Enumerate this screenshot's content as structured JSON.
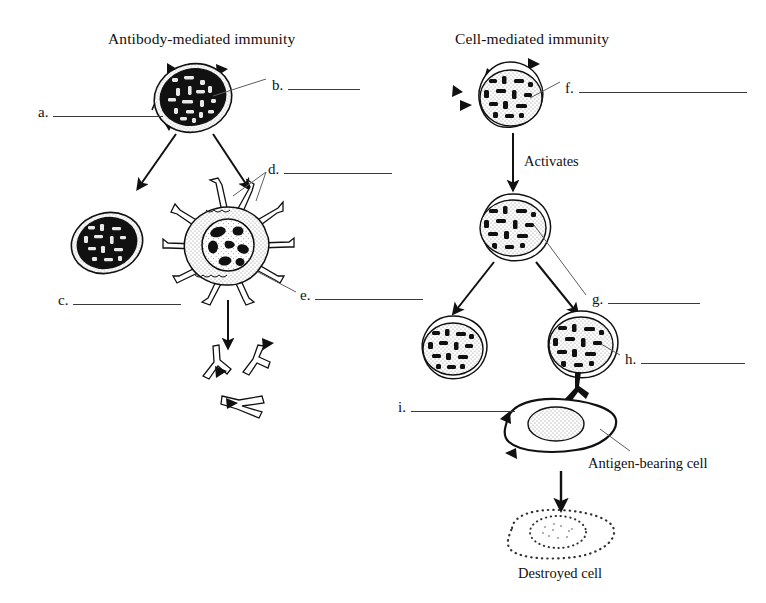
{
  "figure": {
    "type": "biology-diagram",
    "background_color": "#ffffff",
    "ink_color": "#111111"
  },
  "headings": [
    {
      "id": "antibody-mediated-immunity",
      "text": "Antibody-mediated immunity",
      "x": 108,
      "y": 31
    },
    {
      "id": "cell-mediated-immunity",
      "text": "Cell-mediated immunity",
      "x": 455,
      "y": 31
    }
  ],
  "captions": [
    {
      "id": "activates",
      "text": "Activates",
      "x": 524,
      "y": 154
    },
    {
      "id": "antigen-bearing-cell",
      "text": "Antigen-bearing cell",
      "x": 588,
      "y": 456
    },
    {
      "id": "destroyed-cell",
      "text": "Destroyed cell",
      "x": 518,
      "y": 566
    }
  ],
  "blanks": [
    {
      "id": "a",
      "key": "a.",
      "x": 38,
      "y": 105,
      "rule_width": 110,
      "answer": ""
    },
    {
      "id": "b",
      "key": "b.",
      "x": 272,
      "y": 78,
      "rule_width": 72,
      "answer": ""
    },
    {
      "id": "c",
      "key": "c.",
      "x": 58,
      "y": 293,
      "rule_width": 108,
      "answer": ""
    },
    {
      "id": "d",
      "key": "d.",
      "x": 268,
      "y": 162,
      "rule_width": 108,
      "answer": ""
    },
    {
      "id": "e",
      "key": "e.",
      "x": 300,
      "y": 288,
      "rule_width": 108,
      "answer": ""
    },
    {
      "id": "f",
      "key": "f.",
      "x": 565,
      "y": 81,
      "rule_width": 168,
      "answer": ""
    },
    {
      "id": "g",
      "key": "g.",
      "x": 592,
      "y": 292,
      "rule_width": 92,
      "answer": ""
    },
    {
      "id": "h",
      "key": "h.",
      "x": 625,
      "y": 352,
      "rule_width": 104,
      "answer": ""
    },
    {
      "id": "i",
      "key": "i.",
      "x": 398,
      "y": 400,
      "rule_width": 104,
      "answer": ""
    }
  ],
  "cells": [
    {
      "id": "antigen-presenting-lymphocyte-left",
      "label": "lymphocyte with antigens",
      "cx": 193,
      "cy": 97,
      "rx": 40,
      "ry": 34
    },
    {
      "id": "plasma-memory-cell-left",
      "label": "lymphocyte",
      "cx": 107,
      "cy": 243,
      "rx": 36,
      "ry": 30
    },
    {
      "id": "plasma-cell-with-projections",
      "label": "plasma cell with projections",
      "cx": 228,
      "cy": 245,
      "rx": 38,
      "ry": 36
    },
    {
      "id": "lymphocyte-right-top",
      "label": "T lymphocyte",
      "cx": 510,
      "cy": 97,
      "rx": 37,
      "ry": 33
    },
    {
      "id": "lymphocyte-right-middle",
      "label": "activated T lymphocyte",
      "cx": 513,
      "cy": 227,
      "rx": 39,
      "ry": 33
    },
    {
      "id": "lymphocyte-right-lower-left",
      "label": "memory T cell",
      "cx": 453,
      "cy": 349,
      "rx": 35,
      "ry": 31
    },
    {
      "id": "lymphocyte-right-lower-right",
      "label": "cytotoxic T cell",
      "cx": 581,
      "cy": 345,
      "rx": 38,
      "ry": 33
    },
    {
      "id": "antigen-bearing-cell-shape",
      "label": "antigen-bearing cell",
      "cx": 560,
      "cy": 425,
      "rx": 56,
      "ry": 29
    },
    {
      "id": "destroyed-cell-shape",
      "label": "destroyed cell",
      "cx": 561,
      "cy": 535,
      "rx": 55,
      "ry": 26
    }
  ],
  "antibodies": [
    {
      "id": "antibody-1",
      "x": 213,
      "y": 360
    },
    {
      "id": "antibody-2",
      "x": 250,
      "y": 358
    },
    {
      "id": "antibody-3",
      "x": 238,
      "y": 402
    }
  ],
  "arrows": [
    {
      "id": "arrow-left-branch-1",
      "from": [
        174,
        132
      ],
      "to": [
        139,
        186
      ]
    },
    {
      "id": "arrow-left-branch-2",
      "from": [
        213,
        132
      ],
      "to": [
        244,
        186
      ]
    },
    {
      "id": "arrow-plasma-to-antibodies",
      "from": [
        228,
        300
      ],
      "to": [
        228,
        344
      ]
    },
    {
      "id": "arrow-activates",
      "from": [
        513,
        133
      ],
      "to": [
        513,
        186
      ]
    },
    {
      "id": "arrow-right-branch-1",
      "from": [
        494,
        262
      ],
      "to": [
        455,
        311
      ]
    },
    {
      "id": "arrow-right-branch-2",
      "from": [
        536,
        262
      ],
      "to": [
        572,
        311
      ]
    },
    {
      "id": "arrow-to-destroyed-cell",
      "from": [
        561,
        471
      ],
      "to": [
        561,
        505
      ]
    }
  ]
}
